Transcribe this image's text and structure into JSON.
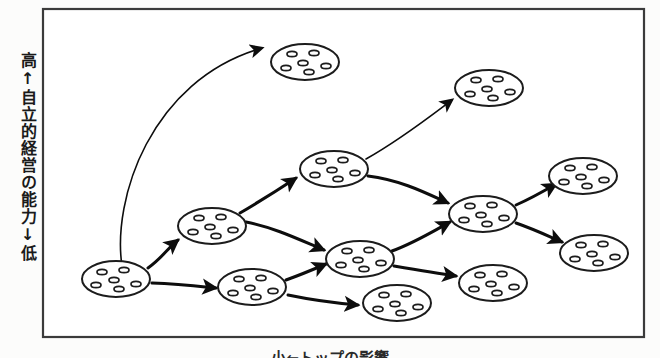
{
  "figure": {
    "type": "diagram",
    "title_visible": false,
    "background_color": "#fcfcfb",
    "frame": {
      "stroke_color": "#3b3b3b",
      "x": 42,
      "y": 8,
      "width": 603,
      "height": 330
    },
    "y_axis_label": "高↑自立的経営の能力↓低",
    "x_axis_label": "小←トップの影響",
    "x_axis_label_clipped": true,
    "ink_color": "#0d0d0d",
    "node_fill": "#ffffff",
    "node_count": 11,
    "arrow_count": 11,
    "node_glyph": "ellipse-with-five-dots",
    "nodes": [
      {
        "id": "n1",
        "label": "group-lower-left",
        "cx": 116,
        "cy": 279,
        "rx": 33,
        "ry": 18,
        "dots": 6
      },
      {
        "id": "n2",
        "label": "group-mid-left",
        "cx": 212,
        "cy": 226,
        "rx": 33,
        "ry": 18,
        "dots": 6
      },
      {
        "id": "n3",
        "label": "group-bottom-second",
        "cx": 256,
        "cy": 287,
        "rx": 33,
        "ry": 18,
        "dots": 6
      },
      {
        "id": "n4",
        "label": "group-top-left",
        "cx": 303,
        "cy": 62,
        "rx": 33,
        "ry": 18,
        "dots": 6
      },
      {
        "id": "n5",
        "label": "group-center-upper",
        "cx": 334,
        "cy": 169,
        "rx": 33,
        "ry": 18,
        "dots": 6
      },
      {
        "id": "n6",
        "label": "group-center-lower",
        "cx": 360,
        "cy": 259,
        "rx": 33,
        "ry": 18,
        "dots": 6
      },
      {
        "id": "n7",
        "label": "group-bottom-center",
        "cx": 397,
        "cy": 303,
        "rx": 33,
        "ry": 18,
        "dots": 6
      },
      {
        "id": "n8",
        "label": "group-top-right",
        "cx": 489,
        "cy": 88,
        "rx": 33,
        "ry": 18,
        "dots": 6
      },
      {
        "id": "n9",
        "label": "group-right-hub",
        "cx": 485,
        "cy": 215,
        "rx": 33,
        "ry": 18,
        "dots": 6
      },
      {
        "id": "n10",
        "label": "group-bottom-right",
        "cx": 495,
        "cy": 285,
        "rx": 33,
        "ry": 18,
        "dots": 6
      },
      {
        "id": "n11",
        "label": "group-far-right-top",
        "cx": 583,
        "cy": 176,
        "rx": 33,
        "ry": 18,
        "dots": 6
      },
      {
        "id": "n12",
        "label": "group-far-right-low",
        "cx": 594,
        "cy": 253,
        "rx": 33,
        "ry": 18,
        "dots": 6
      }
    ],
    "arrows": [
      {
        "id": "a1",
        "from": "n1",
        "to": "n4",
        "style": "curved-long"
      },
      {
        "id": "a2",
        "from": "n1",
        "to": "n2",
        "style": "straight"
      },
      {
        "id": "a3",
        "from": "n1",
        "to": "n3",
        "style": "straight"
      },
      {
        "id": "a4",
        "from": "n2",
        "to": "n5",
        "style": "straight"
      },
      {
        "id": "a5",
        "from": "n2",
        "to": "n6",
        "style": "curved"
      },
      {
        "id": "a6",
        "from": "n3",
        "to": "n6",
        "style": "straight"
      },
      {
        "id": "a7",
        "from": "n3",
        "to": "n7",
        "style": "straight"
      },
      {
        "id": "a8",
        "from": "n5",
        "to": "n8",
        "style": "straight"
      },
      {
        "id": "a9",
        "from": "n5",
        "to": "n9",
        "style": "curved"
      },
      {
        "id": "a10",
        "from": "n6",
        "to": "n9",
        "style": "straight"
      },
      {
        "id": "a11",
        "from": "n6",
        "to": "n10",
        "style": "straight"
      },
      {
        "id": "a12",
        "from": "n9",
        "to": "n11",
        "style": "straight"
      },
      {
        "id": "a13",
        "from": "n9",
        "to": "n12",
        "style": "curved"
      }
    ]
  }
}
